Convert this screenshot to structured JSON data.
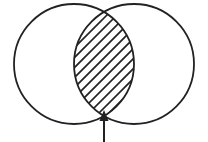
{
  "figure": {
    "background_color": "#ffffff",
    "stroke_color": "#222222",
    "hatch_color": "#222222",
    "fill_color": "#ffffff",
    "canvas": {
      "width": 208,
      "height": 142
    }
  },
  "shapes": {
    "left_circle": {
      "label": "left-circle",
      "cx": 74,
      "cy": 64,
      "r": 60,
      "stroke_width": 1.8
    },
    "right_circle": {
      "label": "right-circle",
      "cx": 134,
      "cy": 64,
      "r": 60,
      "stroke_width": 1.8
    },
    "intersection_lens": {
      "label": "intersection-region",
      "top_cusp_x": 104,
      "top_cusp_y": 12,
      "bottom_cusp_x": 104,
      "bottom_cusp_y": 116,
      "fill_pattern": "diagonal-hatch",
      "hatch_angle_degrees": 45,
      "hatch_spacing": 10,
      "hatch_line_width": 1.6,
      "hatch_line_count": 12
    },
    "pointer_arrow": {
      "label": "arrow-pointing-to-intersection",
      "direction": "up",
      "shaft_x": 104,
      "shaft_bottom_y": 142,
      "shaft_top_y": 120,
      "shaft_width": 2,
      "head_tip_y": 110,
      "head_base_y": 121,
      "head_half_width": 4.5
    }
  }
}
